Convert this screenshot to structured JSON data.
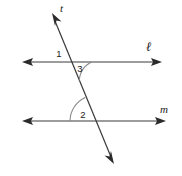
{
  "figure": {
    "background_color": "#ffffff",
    "line_color": "#3a3a3a",
    "arc_color": "#8a8a8a",
    "label_color": "#1a1a1a"
  },
  "lines": [
    {
      "id": "line-l",
      "label": "ℓ",
      "label_x": 146,
      "label_y": 51,
      "y": 62,
      "x_start": 22,
      "x_end": 162,
      "double_arrow": true
    },
    {
      "id": "line-m",
      "label": "m",
      "label_x": 160,
      "label_y": 113,
      "y": 121,
      "x_start": 22,
      "x_end": 166,
      "double_arrow": true
    }
  ],
  "transversal": {
    "id": "line-t",
    "label": "t",
    "label_x": 60,
    "label_y": 12,
    "x1": 52,
    "y1": 13,
    "x2": 114,
    "y2": 164,
    "double_arrow": true
  },
  "intersections": [
    {
      "id": "intersection-upper",
      "x": 72,
      "y": 62,
      "on_line": "ℓ"
    },
    {
      "id": "intersection-lower",
      "x": 96,
      "y": 121,
      "on_line": "m"
    }
  ],
  "angles": [
    {
      "id": "angle-1",
      "label": "1",
      "label_x": 59,
      "label_y": 57,
      "vertex_x": 72,
      "vertex_y": 62,
      "position": "upper-left-of-upper-intersection",
      "has_arc": false
    },
    {
      "id": "angle-3",
      "label": "3",
      "label_x": 80,
      "label_y": 72,
      "vertex_x": 72,
      "vertex_y": 62,
      "position": "lower-right-of-upper-intersection",
      "has_arc": true,
      "arc_radius": 20
    },
    {
      "id": "angle-2",
      "label": "2",
      "label_x": 83,
      "label_y": 118,
      "vertex_x": 96,
      "vertex_y": 121,
      "position": "upper-left-of-lower-intersection",
      "has_arc": true,
      "arc_radius": 26
    }
  ]
}
